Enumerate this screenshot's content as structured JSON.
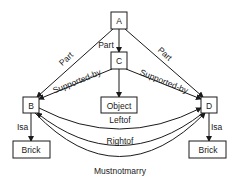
{
  "diagram": {
    "type": "semantic-network",
    "nodes": {
      "A": {
        "label": "A"
      },
      "C": {
        "label": "C"
      },
      "B": {
        "label": "B"
      },
      "D": {
        "label": "D"
      },
      "object": {
        "label": "Object"
      },
      "brick_left": {
        "label": "Brick"
      },
      "brick_right": {
        "label": "Brick"
      }
    },
    "edges": {
      "a_b": {
        "from": "A",
        "to": "B",
        "label": "Part"
      },
      "a_c": {
        "from": "A",
        "to": "C",
        "label": "Part"
      },
      "a_d": {
        "from": "A",
        "to": "D",
        "label": "Part"
      },
      "c_b": {
        "from": "C",
        "to": "B",
        "label": "Supported-by"
      },
      "c_d": {
        "from": "C",
        "to": "D",
        "label": "Supported-by"
      },
      "c_object": {
        "from": "C",
        "to": "Object",
        "label": ""
      },
      "b_brick": {
        "from": "B",
        "to": "Brick",
        "label": "Isa"
      },
      "d_brick": {
        "from": "D",
        "to": "Brick",
        "label": "Isa"
      },
      "leftof": {
        "from": "B",
        "to": "D",
        "label": "Leftof"
      },
      "rightof": {
        "from": "D",
        "to": "B",
        "label": "Rightof"
      },
      "mustnotmarry": {
        "from": "B",
        "to": "D",
        "label": "Mustnotmarry"
      }
    }
  }
}
